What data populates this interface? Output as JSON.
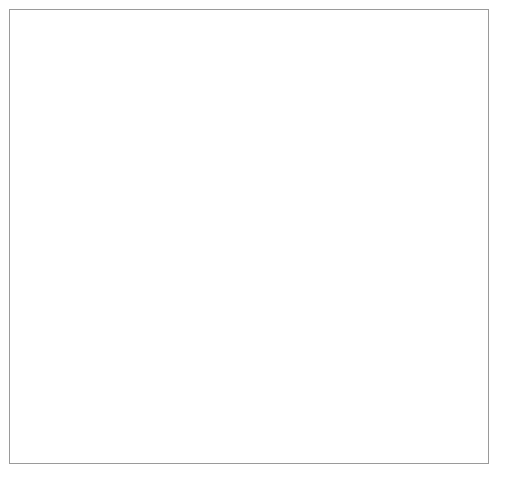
{
  "figure": {
    "background": "#ffffff",
    "frame_color": "#9a9a9a",
    "marker_color": "#111111",
    "axis_color": "#6e6e6e"
  },
  "chart_data": [
    {
      "type": "line",
      "panel": "top",
      "title": "",
      "xlabel": "",
      "ylabel": "Hen fleas",
      "y2label": "Moorhen fleas",
      "x": [
        1974,
        1975,
        1976,
        1977,
        1978,
        1979,
        1980,
        1981,
        1982,
        1983
      ],
      "categories": [
        "1974",
        "1975",
        "1976",
        "1977",
        "1978",
        "1979",
        "1980",
        "1981",
        "1982",
        "1983"
      ],
      "xlim": [
        1973.6,
        1983.3
      ],
      "ylim": [
        0,
        20000
      ],
      "y2lim": [
        0,
        4000
      ],
      "yticks": [
        0,
        5000,
        10000,
        15000,
        20000
      ],
      "ytick_labels": [
        "0",
        "5000",
        "10000",
        "15000",
        "20000"
      ],
      "y2ticks": [
        0,
        1000,
        2000,
        3000,
        4000
      ],
      "y2tick_labels": [
        "0",
        "1000",
        "2000",
        "3000",
        "4000"
      ],
      "grid": false,
      "legend_position": "inline-annotation",
      "series": [
        {
          "name": "Hen fleas",
          "axis": "left",
          "marker": "filled-circle",
          "values": [
            2900,
            6900,
            9950,
            16700,
            13600,
            8700,
            17300,
            10800,
            5300,
            18700
          ]
        },
        {
          "name": "Moorhen fleas",
          "axis": "right",
          "marker": "open-circle",
          "values": [
            780,
            790,
            1650,
            1870,
            1800,
            580,
            840,
            1420,
            400,
            3590
          ]
        }
      ],
      "annotations": [
        {
          "text": "Hen fleas",
          "x": 1978.0,
          "y": 14600
        },
        {
          "text": "Moorhen fleas",
          "x": 1979.3,
          "y": 6300
        }
      ]
    },
    {
      "type": "line",
      "panel": "bottom",
      "title": "",
      "xlabel": "Year",
      "ylabel": "Occupied boxes",
      "x": [
        1974,
        1975,
        1976,
        1977,
        1978,
        1979,
        1980,
        1981,
        1982,
        1983
      ],
      "categories": [
        "1974",
        "1975",
        "1976",
        "1977",
        "1978",
        "1979",
        "1980",
        "1981",
        "1982",
        "1983"
      ],
      "xlim": [
        1973.6,
        1983.3
      ],
      "ylim": [
        0,
        42
      ],
      "yticks": [
        0,
        10,
        20,
        30,
        40
      ],
      "ytick_labels": [
        "0",
        "10",
        "20",
        "30",
        "40"
      ],
      "grid": false,
      "series": [
        {
          "name": "Occupied boxes",
          "axis": "left",
          "marker": "filled-square",
          "values": [
            29,
            33,
            19,
            29,
            31,
            17,
            27,
            34,
            11,
            31
          ]
        }
      ]
    }
  ],
  "top_panel": {
    "y_axis_title": "Hen fleas",
    "y2_axis_title": "Moorhen fleas",
    "y_tick_labels": [
      "20000",
      "15000",
      "10000",
      "5000",
      "0"
    ],
    "y2_tick_labels": [
      "4000",
      "3000",
      "2000",
      "1000",
      "0"
    ],
    "x_tick_labels": [
      "1974",
      "1975",
      "1976",
      "1977",
      "1978",
      "1979",
      "1980",
      "1981",
      "1982",
      "1983"
    ],
    "label_hen": "Hen fleas",
    "label_moorhen": "Moorhen fleas"
  },
  "bottom_panel": {
    "y_axis_title": "Occupied boxes",
    "y_tick_labels": [
      "40",
      "30",
      "20",
      "10",
      "0"
    ],
    "x_tick_labels": [
      "1974",
      "1975",
      "1976",
      "1977",
      "1978",
      "1979",
      "1980",
      "1981",
      "1982",
      "1983"
    ],
    "x_axis_title": "Year"
  }
}
